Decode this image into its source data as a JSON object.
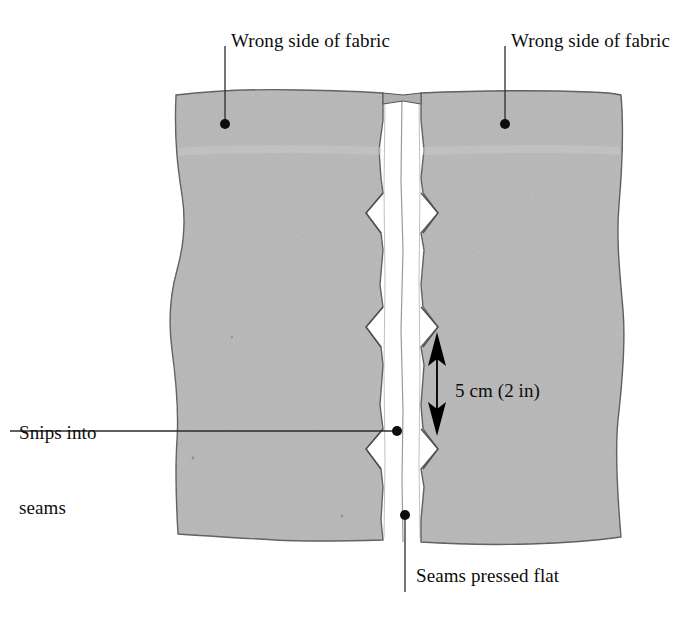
{
  "figure": {
    "type": "illustration"
  },
  "colors": {
    "background": "#ffffff",
    "fabric_fill": "#b7b7b7",
    "fabric_fill_light": "#c0c0c0",
    "fabric_outline": "#4a4a4a",
    "seam_white": "#ffffff",
    "ink": "#0d0d0d",
    "leader_line": "#2b2b2b"
  },
  "labels": {
    "wrong_side_left": "Wrong side of fabric",
    "wrong_side_right": "Wrong side of fabric",
    "snips_line1": "Snips into",
    "snips_line2": "seams",
    "measure": "5 cm (2 in)",
    "seams_pressed_flat": "Seams pressed flat"
  },
  "annotations": [
    {
      "name": "wrong-side-left",
      "text": "Wrong side of fabric",
      "leader_from": {
        "x": 225,
        "y": 46
      },
      "leader_to": {
        "x": 225,
        "y": 124
      },
      "dot": {
        "x": 225,
        "y": 124
      }
    },
    {
      "name": "wrong-side-right",
      "text": "Wrong side of fabric",
      "leader_from": {
        "x": 505,
        "y": 46
      },
      "leader_to": {
        "x": 505,
        "y": 124
      },
      "dot": {
        "x": 505,
        "y": 124
      }
    },
    {
      "name": "snips-into-seams",
      "text": "Snips into seams",
      "leader_from": {
        "x": 10,
        "y": 431
      },
      "leader_to": {
        "x": 396,
        "y": 431
      },
      "dot": {
        "x": 396,
        "y": 431
      }
    },
    {
      "name": "seams-pressed-flat",
      "text": "Seams pressed flat",
      "leader_from": {
        "x": 405,
        "y": 515
      },
      "leader_to": {
        "x": 405,
        "y": 592
      },
      "dot": {
        "x": 405,
        "y": 515
      }
    }
  ],
  "measurement": {
    "label": "5 cm (2 in)",
    "value": 5,
    "unit": "cm",
    "alt_value": 2,
    "alt_unit": "in",
    "arrow": {
      "x": 437,
      "y_top": 334,
      "y_bottom": 433,
      "style": "double-headed"
    }
  },
  "seam": {
    "snip_positions_y": [
      195,
      310,
      432
    ],
    "channel_x_left": 383,
    "channel_x_right": 421,
    "stitch_line_x": 403
  },
  "fabric": {
    "top_y": 92,
    "bottom_y": 545,
    "left_x": 175,
    "right_x": 622
  }
}
